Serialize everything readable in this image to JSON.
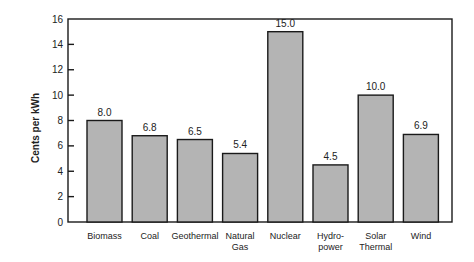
{
  "chart_data": {
    "type": "bar",
    "title": "",
    "xlabel": "",
    "ylabel": "Cents per kWh",
    "ylim": [
      0,
      16
    ],
    "yticks": [
      0,
      2,
      4,
      6,
      8,
      10,
      12,
      14,
      16
    ],
    "grid": false,
    "legend": null,
    "categories": [
      "Biomass",
      "Coal",
      "Geothermal",
      "Natural Gas",
      "Nuclear",
      "Hydro-power",
      "Solar Thermal",
      "Wind"
    ],
    "category_label_lines": [
      [
        "Biomass"
      ],
      [
        "Coal"
      ],
      [
        "Geothermal"
      ],
      [
        "Natural",
        "Gas"
      ],
      [
        "Nuclear"
      ],
      [
        "Hydro-",
        "power"
      ],
      [
        "Solar",
        "Thermal"
      ],
      [
        "Wind"
      ]
    ],
    "values": [
      8.0,
      6.8,
      6.5,
      5.4,
      15.0,
      4.5,
      10.0,
      6.9
    ],
    "value_labels": [
      "8.0",
      "6.8",
      "6.5",
      "5.4",
      "15.0",
      "4.5",
      "10.0",
      "6.9"
    ],
    "bar_color": "#b4b4b4",
    "edge_color": "#1a1a1a"
  }
}
